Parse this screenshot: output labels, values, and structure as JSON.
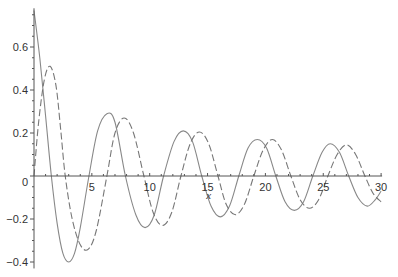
{
  "chart_data": {
    "type": "line",
    "title": "",
    "xlabel": "x",
    "ylabel": "",
    "xlim": [
      0,
      30
    ],
    "ylim": [
      -0.43,
      0.78
    ],
    "grid": false,
    "legend": null,
    "x_ticks": [
      5,
      10,
      15,
      20,
      25,
      30
    ],
    "x_tick_labels": [
      "5",
      "10",
      "15",
      "20",
      "25",
      "30"
    ],
    "y_ticks": [
      0.6,
      0.4,
      0.2,
      0,
      -0.2,
      -0.4
    ],
    "y_tick_labels": [
      "0.6",
      "0.4",
      "0.2",
      "0",
      "−0.2",
      "−0.4"
    ],
    "series": [
      {
        "name": "solid",
        "style": "solid",
        "color": "#888888",
        "points": [
          [
            0,
            0.77
          ],
          [
            0.5,
            0.55
          ],
          [
            1.0,
            0.28
          ],
          [
            1.5,
            0.0
          ],
          [
            2.0,
            -0.22
          ],
          [
            2.5,
            -0.36
          ],
          [
            3.0,
            -0.4
          ],
          [
            3.5,
            -0.36
          ],
          [
            4.0,
            -0.24
          ],
          [
            4.75,
            0.0
          ],
          [
            5.5,
            0.21
          ],
          [
            6.3,
            0.29
          ],
          [
            7.0,
            0.25
          ],
          [
            7.9,
            0.0
          ],
          [
            8.8,
            -0.18
          ],
          [
            9.6,
            -0.24
          ],
          [
            10.4,
            -0.18
          ],
          [
            11.2,
            0.0
          ],
          [
            12.1,
            0.16
          ],
          [
            12.9,
            0.21
          ],
          [
            13.7,
            0.16
          ],
          [
            14.5,
            0.0
          ],
          [
            15.3,
            -0.14
          ],
          [
            16.1,
            -0.19
          ],
          [
            16.9,
            -0.14
          ],
          [
            17.7,
            0.0
          ],
          [
            18.5,
            0.13
          ],
          [
            19.3,
            0.17
          ],
          [
            20.1,
            0.13
          ],
          [
            20.9,
            0.0
          ],
          [
            21.7,
            -0.12
          ],
          [
            22.5,
            -0.16
          ],
          [
            23.3,
            -0.12
          ],
          [
            24.1,
            0.0
          ],
          [
            24.9,
            0.11
          ],
          [
            25.6,
            0.15
          ],
          [
            26.4,
            0.11
          ],
          [
            27.2,
            0.0
          ],
          [
            28.0,
            -0.1
          ],
          [
            28.8,
            -0.14
          ],
          [
            29.5,
            -0.11
          ],
          [
            30.0,
            -0.07
          ]
        ]
      },
      {
        "name": "dashed",
        "style": "dashed",
        "color": "#777777",
        "points": [
          [
            0,
            0.0
          ],
          [
            0.4,
            0.25
          ],
          [
            0.9,
            0.45
          ],
          [
            1.4,
            0.51
          ],
          [
            1.9,
            0.42
          ],
          [
            2.3,
            0.22
          ],
          [
            2.7,
            0.0
          ],
          [
            3.3,
            -0.2
          ],
          [
            4.0,
            -0.32
          ],
          [
            4.7,
            -0.34
          ],
          [
            5.4,
            -0.25
          ],
          [
            6.3,
            0.0
          ],
          [
            7.0,
            0.2
          ],
          [
            7.8,
            0.27
          ],
          [
            8.6,
            0.2
          ],
          [
            9.5,
            0.0
          ],
          [
            10.3,
            -0.17
          ],
          [
            11.1,
            -0.23
          ],
          [
            11.9,
            -0.17
          ],
          [
            12.7,
            0.0
          ],
          [
            13.5,
            0.15
          ],
          [
            14.3,
            0.205
          ],
          [
            15.1,
            0.15
          ],
          [
            15.9,
            0.0
          ],
          [
            16.6,
            -0.13
          ],
          [
            17.4,
            -0.18
          ],
          [
            18.2,
            -0.13
          ],
          [
            19.0,
            0.0
          ],
          [
            19.8,
            0.12
          ],
          [
            20.6,
            0.17
          ],
          [
            21.4,
            0.12
          ],
          [
            22.2,
            0.0
          ],
          [
            23.0,
            -0.11
          ],
          [
            23.8,
            -0.15
          ],
          [
            24.6,
            -0.11
          ],
          [
            25.4,
            0.0
          ],
          [
            26.2,
            0.1
          ],
          [
            27.0,
            0.145
          ],
          [
            27.8,
            0.1
          ],
          [
            28.6,
            0.0
          ],
          [
            29.3,
            -0.08
          ],
          [
            30.0,
            -0.12
          ]
        ]
      }
    ]
  },
  "plot_area": {
    "x0_px": 34,
    "x_px_per_unit": 11.57,
    "y0_px": 176,
    "y_px_per_unit": 215
  }
}
